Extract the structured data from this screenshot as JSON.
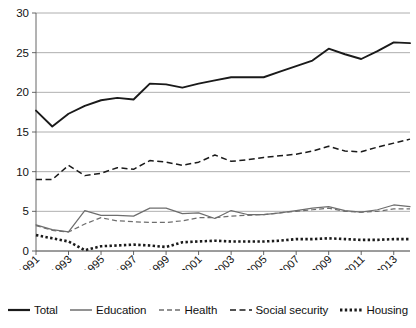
{
  "chart_data": {
    "type": "line",
    "title": "",
    "xlabel": "",
    "ylabel": "",
    "ylim": [
      0,
      30
    ],
    "ytick_values": [
      0,
      5,
      10,
      15,
      20,
      25,
      30
    ],
    "ytick_labels": [
      "0",
      "5",
      "10",
      "15",
      "20",
      "25",
      "30"
    ],
    "grid": true,
    "legend_position": "bottom",
    "x": [
      1991,
      1992,
      1993,
      1994,
      1995,
      1996,
      1997,
      1998,
      1999,
      2000,
      2001,
      2002,
      2003,
      2004,
      2005,
      2006,
      2007,
      2008,
      2009,
      2010,
      2011,
      2012,
      2013,
      2014
    ],
    "xtick_labels": [
      "1991",
      "1993",
      "1995",
      "1997",
      "1999",
      "2001",
      "2003",
      "2005",
      "2007",
      "2009",
      "2011",
      "2013"
    ],
    "xtick_values": [
      1991,
      1993,
      1995,
      1997,
      1999,
      2001,
      2003,
      2005,
      2007,
      2009,
      2011,
      2013
    ],
    "series": [
      {
        "name": "Total",
        "style": "solid",
        "color": "#1a1a1a",
        "values": [
          17.7,
          15.7,
          17.3,
          18.3,
          19.0,
          19.3,
          19.1,
          21.1,
          21.0,
          20.6,
          21.1,
          21.5,
          21.9,
          21.9,
          21.9,
          22.6,
          23.3,
          24.0,
          25.5,
          24.8,
          24.2,
          25.2,
          26.3,
          26.2
        ]
      },
      {
        "name": "Education",
        "style": "solid",
        "color": "#6e6e6e",
        "values": [
          3.3,
          2.7,
          2.4,
          5.1,
          4.5,
          4.5,
          4.4,
          5.4,
          5.4,
          4.7,
          4.8,
          4.1,
          5.1,
          4.6,
          4.6,
          4.8,
          5.1,
          5.4,
          5.6,
          5.1,
          4.9,
          5.2,
          5.8,
          5.6
        ]
      },
      {
        "name": "Health",
        "style": "dashed",
        "color": "#6e6e6e",
        "values": [
          3.2,
          2.6,
          2.4,
          3.4,
          4.2,
          3.8,
          3.7,
          3.6,
          3.6,
          3.8,
          4.2,
          4.2,
          4.4,
          4.5,
          4.6,
          4.8,
          5.0,
          5.2,
          5.4,
          5.0,
          4.9,
          5.0,
          5.3,
          5.3
        ]
      },
      {
        "name": "Social security",
        "style": "dashed",
        "color": "#1a1a1a",
        "values": [
          9.0,
          9.0,
          10.8,
          9.5,
          9.8,
          10.5,
          10.3,
          11.4,
          11.2,
          10.8,
          11.2,
          12.1,
          11.3,
          11.5,
          11.8,
          12.0,
          12.2,
          12.6,
          13.2,
          12.6,
          12.5,
          13.1,
          13.6,
          14.1
        ]
      },
      {
        "name": "Housing",
        "style": "dotted",
        "color": "#1a1a1a",
        "values": [
          2.0,
          1.6,
          1.2,
          0.1,
          0.6,
          0.7,
          0.8,
          0.7,
          0.5,
          1.1,
          1.2,
          1.3,
          1.2,
          1.2,
          1.2,
          1.3,
          1.5,
          1.5,
          1.6,
          1.5,
          1.4,
          1.4,
          1.5,
          1.5
        ]
      }
    ]
  },
  "legend": {
    "items": [
      {
        "label": "Total",
        "swatch": "solid-black-thick"
      },
      {
        "label": "Education",
        "swatch": "solid-gray"
      },
      {
        "label": "Health",
        "swatch": "dashed-gray"
      },
      {
        "label": "Social security",
        "swatch": "dashed-black"
      },
      {
        "label": "Housing",
        "swatch": "dotted-black"
      }
    ]
  }
}
